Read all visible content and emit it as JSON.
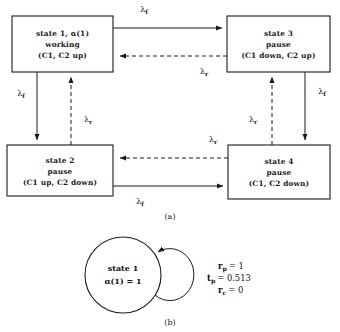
{
  "figure": {
    "panels": [
      {
        "id": "a",
        "label": "(a)"
      },
      {
        "id": "b",
        "label": "(b)"
      }
    ]
  },
  "diagram_a": {
    "type": "state-transition-diagram",
    "states": [
      {
        "id": "state1",
        "lines": [
          "state 1, α(1)",
          "working",
          "(C1, C2 up)"
        ]
      },
      {
        "id": "state3",
        "lines": [
          "state 3",
          "pause",
          "(C1 down, C2 up)"
        ]
      },
      {
        "id": "state2",
        "lines": [
          "state 2",
          "pause",
          "(C1 up, C2 down)"
        ]
      },
      {
        "id": "state4",
        "lines": [
          "state 4",
          "pause",
          "(C1, C2 down)"
        ]
      }
    ],
    "transitions": [
      {
        "id": "t1-3",
        "from": "state1",
        "to": "state3",
        "style": "solid",
        "symbol": "λ",
        "subscript": "f"
      },
      {
        "id": "t3-1",
        "from": "state3",
        "to": "state1",
        "style": "dashed",
        "symbol": "λ",
        "subscript": "r"
      },
      {
        "id": "t1-2",
        "from": "state1",
        "to": "state2",
        "style": "solid",
        "symbol": "λ",
        "subscript": "f"
      },
      {
        "id": "t2-1",
        "from": "state2",
        "to": "state1",
        "style": "dashed",
        "symbol": "λ",
        "subscript": "r"
      },
      {
        "id": "t3-4",
        "from": "state3",
        "to": "state4",
        "style": "solid",
        "symbol": "λ",
        "subscript": "f"
      },
      {
        "id": "t4-3",
        "from": "state4",
        "to": "state3",
        "style": "dashed",
        "symbol": "λ",
        "subscript": "r"
      },
      {
        "id": "t2-4",
        "from": "state2",
        "to": "state4",
        "style": "solid",
        "symbol": "λ",
        "subscript": "f"
      },
      {
        "id": "t4-2",
        "from": "state4",
        "to": "state2",
        "style": "dashed",
        "symbol": "λ",
        "subscript": "r"
      }
    ]
  },
  "diagram_b": {
    "type": "single-state-self-loop",
    "state": {
      "id": "state1",
      "line1": "state 1",
      "line2": "α(1) = 1"
    },
    "parameters": [
      {
        "var": "r",
        "sub": "p",
        "eq": "= 1"
      },
      {
        "var": "t",
        "sub": "p",
        "eq": "= 0.513"
      },
      {
        "var": "r",
        "sub": "c",
        "eq": "= 0"
      }
    ]
  },
  "colors": {
    "ink": "#1a1a1a",
    "paper": "#ffffff"
  }
}
